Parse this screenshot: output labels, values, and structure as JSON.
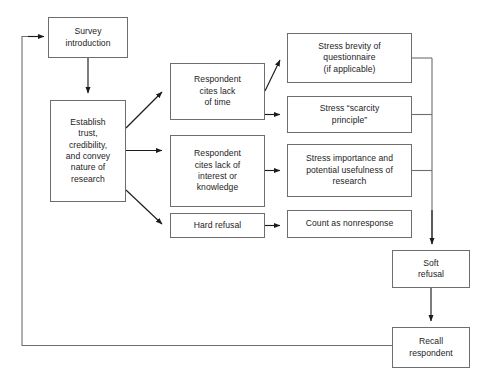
{
  "diagram": {
    "stroke_color": "#6e6e6e",
    "text_color": "#1c1c1c",
    "background_color": "#ffffff",
    "nodes": [
      {
        "id": "survey-introduction",
        "label": "Survey\nintroduction",
        "x": 48,
        "y": 17,
        "w": 80,
        "h": 41
      },
      {
        "id": "establish-trust",
        "label": "Establish\ntrust,\ncredibility,\nand convey\nnature of\nresearch",
        "x": 50,
        "y": 100,
        "w": 76,
        "h": 102
      },
      {
        "id": "cites-lack-of-time",
        "label": "Respondent\ncites lack\nof time",
        "x": 170,
        "y": 63,
        "w": 95,
        "h": 57
      },
      {
        "id": "cites-lack-of-interest",
        "label": "Respondent\ncites lack of\ninterest or\nknowledge",
        "x": 170,
        "y": 135,
        "w": 95,
        "h": 72
      },
      {
        "id": "hard-refusal",
        "label": "Hard refusal",
        "x": 170,
        "y": 213,
        "w": 95,
        "h": 25
      },
      {
        "id": "stress-brevity",
        "label": "Stress brevity of\nquestionnaire\n(if applicable)",
        "x": 287,
        "y": 33,
        "w": 125,
        "h": 50
      },
      {
        "id": "stress-scarcity",
        "label": "Stress “scarcity\nprinciple”",
        "x": 287,
        "y": 96,
        "w": 125,
        "h": 37
      },
      {
        "id": "stress-importance",
        "label": "Stress importance and\npotential usefulness of\nresearch",
        "x": 287,
        "y": 144,
        "w": 125,
        "h": 53
      },
      {
        "id": "count-as-nonresponse",
        "label": "Count as nonresponse",
        "x": 287,
        "y": 210,
        "w": 125,
        "h": 28
      },
      {
        "id": "soft-refusal",
        "label": "Soft\nrefusal",
        "x": 392,
        "y": 250,
        "w": 78,
        "h": 38
      },
      {
        "id": "recall-respondent",
        "label": "Recall\nrespondent",
        "x": 392,
        "y": 327,
        "w": 78,
        "h": 41
      }
    ],
    "edges": [
      {
        "id": "intro-to-establish",
        "from": "survey-introduction",
        "to": "establish-trust",
        "kind": "arrow-down"
      },
      {
        "id": "establish-to-time",
        "from": "establish-trust",
        "to": "cites-lack-of-time",
        "kind": "arrow-diagonal-up"
      },
      {
        "id": "establish-to-interest",
        "from": "establish-trust",
        "to": "cites-lack-of-interest",
        "kind": "arrow-right"
      },
      {
        "id": "establish-to-hard-refusal",
        "from": "establish-trust",
        "to": "hard-refusal",
        "kind": "arrow-diagonal-down"
      },
      {
        "id": "time-to-brevity",
        "from": "cites-lack-of-time",
        "to": "stress-brevity",
        "kind": "arrow-diagonal-up"
      },
      {
        "id": "time-to-scarcity",
        "from": "cites-lack-of-time",
        "to": "stress-scarcity",
        "kind": "arrow-right"
      },
      {
        "id": "interest-to-importance",
        "from": "cites-lack-of-interest",
        "to": "stress-importance",
        "kind": "arrow-right"
      },
      {
        "id": "hard-refusal-to-nonresponse",
        "from": "hard-refusal",
        "to": "count-as-nonresponse",
        "kind": "arrow-right"
      },
      {
        "id": "brevity-to-bus",
        "from": "stress-brevity",
        "to": "soft-refusal",
        "kind": "bus-line"
      },
      {
        "id": "scarcity-to-bus",
        "from": "stress-scarcity",
        "to": "soft-refusal",
        "kind": "bus-line"
      },
      {
        "id": "importance-to-bus",
        "from": "stress-importance",
        "to": "soft-refusal",
        "kind": "bus-line"
      },
      {
        "id": "bus-to-soft-refusal",
        "from": "stress-boxes-bus",
        "to": "soft-refusal",
        "kind": "arrow-down"
      },
      {
        "id": "soft-refusal-to-recall",
        "from": "soft-refusal",
        "to": "recall-respondent",
        "kind": "arrow-down"
      },
      {
        "id": "recall-to-intro-feedback",
        "from": "recall-respondent",
        "to": "survey-introduction",
        "kind": "feedback-loop-arrow-right"
      }
    ]
  }
}
